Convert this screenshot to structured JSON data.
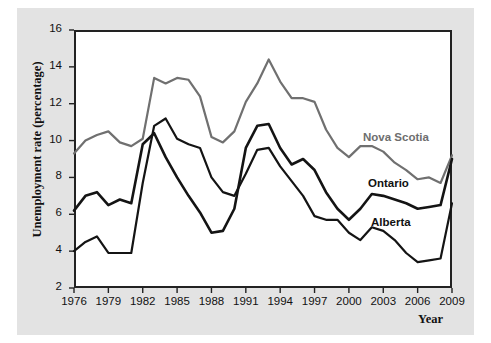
{
  "chart_data": {
    "type": "line",
    "title": "",
    "xlabel": "Year",
    "ylabel": "Unemployment rate (percentage)",
    "xlim": [
      1976,
      2009
    ],
    "ylim": [
      2,
      16
    ],
    "ytick_values": [
      2,
      4,
      6,
      8,
      10,
      12,
      14,
      16
    ],
    "ytick_labels": [
      "2",
      "4",
      "6",
      "8",
      "10",
      "12",
      "14",
      "16"
    ],
    "xtick_values": [
      1976,
      1979,
      1982,
      1985,
      1988,
      1991,
      1994,
      1997,
      2000,
      2003,
      2006,
      2009
    ],
    "xtick_labels": [
      "1976",
      "1979",
      "1982",
      "1985",
      "1988",
      "1991",
      "1994",
      "1997",
      "2000",
      "2003",
      "2006",
      "2009"
    ],
    "grid": false,
    "legend_position": "inline-labels",
    "x": [
      1976,
      1977,
      1978,
      1979,
      1980,
      1981,
      1982,
      1983,
      1984,
      1985,
      1986,
      1987,
      1988,
      1989,
      1990,
      1991,
      1992,
      1993,
      1994,
      1995,
      1996,
      1997,
      1998,
      1999,
      2000,
      2001,
      2002,
      2003,
      2004,
      2005,
      2006,
      2007,
      2008,
      2009
    ],
    "series": [
      {
        "name": "Nova Scotia",
        "color": "#707070",
        "width": 2.2,
        "label_x": 1999.5,
        "label_y": 10.4,
        "values": [
          9.3,
          10.0,
          10.3,
          10.5,
          9.9,
          9.7,
          10.1,
          13.4,
          13.1,
          13.4,
          13.3,
          12.4,
          10.2,
          9.9,
          10.5,
          12.1,
          13.1,
          14.4,
          13.2,
          12.3,
          12.3,
          12.1,
          10.6,
          9.6,
          9.1,
          9.7,
          9.7,
          9.4,
          8.8,
          8.4,
          7.9,
          8.0,
          7.7,
          9.2
        ]
      },
      {
        "name": "Ontario",
        "color": "#141414",
        "width": 2.6,
        "label_x": 2000.0,
        "label_y": 8.0,
        "values": [
          6.2,
          7.0,
          7.2,
          6.5,
          6.8,
          6.6,
          9.8,
          10.4,
          9.1,
          8.0,
          7.0,
          6.1,
          5.0,
          5.1,
          6.3,
          9.6,
          10.8,
          10.9,
          9.6,
          8.7,
          9.0,
          8.4,
          7.2,
          6.3,
          5.7,
          6.3,
          7.1,
          7.0,
          6.8,
          6.6,
          6.3,
          6.4,
          6.5,
          9.0
        ]
      },
      {
        "name": "Alberta",
        "color": "#141414",
        "width": 2.2,
        "label_x": 2000.5,
        "label_y": 6.1,
        "values": [
          4.0,
          4.5,
          4.8,
          3.9,
          3.9,
          3.9,
          7.7,
          10.8,
          11.2,
          10.1,
          9.8,
          9.6,
          8.0,
          7.2,
          7.0,
          8.2,
          9.5,
          9.6,
          8.6,
          7.8,
          7.0,
          5.9,
          5.7,
          5.7,
          5.0,
          4.6,
          5.3,
          5.1,
          4.6,
          3.9,
          3.4,
          3.5,
          3.6,
          6.6
        ]
      }
    ]
  },
  "axis": {
    "y_title": "Unemployment rate (percentage)",
    "x_title": "Year"
  }
}
